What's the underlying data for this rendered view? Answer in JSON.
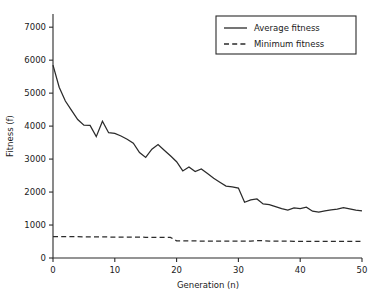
{
  "chart_data": {
    "type": "line",
    "title": "",
    "xlabel": "Generation (n)",
    "ylabel": "Fitness (f)",
    "xlim": [
      0,
      50
    ],
    "ylim": [
      0,
      7400
    ],
    "xticks": [
      0,
      10,
      20,
      30,
      40,
      50
    ],
    "yticks": [
      0,
      1000,
      2000,
      3000,
      4000,
      5000,
      6000,
      7000
    ],
    "xtick_labels": [
      "0",
      "10",
      "20",
      "30",
      "40",
      "50"
    ],
    "ytick_labels": [
      "0",
      "1000",
      "2000",
      "3000",
      "4000",
      "5000",
      "6000",
      "7000"
    ],
    "grid": false,
    "legend_position": "top-right",
    "line_color": "#2b2b2b",
    "background_color": "#ffffff",
    "x": [
      0,
      1,
      2,
      3,
      4,
      5,
      6,
      7,
      8,
      9,
      10,
      11,
      12,
      13,
      14,
      15,
      16,
      17,
      18,
      19,
      20,
      21,
      22,
      23,
      24,
      25,
      26,
      27,
      28,
      29,
      30,
      31,
      32,
      33,
      34,
      35,
      36,
      37,
      38,
      39,
      40,
      41,
      42,
      43,
      44,
      45,
      46,
      47,
      48,
      49,
      50
    ],
    "series": [
      {
        "name": "Average fitness",
        "style": "solid",
        "values": [
          5850,
          5180,
          4760,
          4480,
          4200,
          4030,
          4020,
          3680,
          4150,
          3800,
          3780,
          3700,
          3600,
          3480,
          3200,
          3050,
          3300,
          3440,
          3270,
          3100,
          2920,
          2640,
          2760,
          2620,
          2700,
          2560,
          2420,
          2300,
          2180,
          2160,
          2120,
          1690,
          1760,
          1790,
          1640,
          1620,
          1560,
          1500,
          1450,
          1520,
          1500,
          1540,
          1420,
          1390,
          1430,
          1460,
          1480,
          1530,
          1490,
          1450,
          1430
        ]
      },
      {
        "name": "Minimum fitness",
        "style": "dashed",
        "values": [
          650,
          650,
          648,
          646,
          645,
          643,
          642,
          640,
          638,
          637,
          636,
          634,
          633,
          632,
          630,
          629,
          628,
          626,
          625,
          624,
          520,
          518,
          517,
          516,
          515,
          514,
          513,
          512,
          512,
          511,
          510,
          510,
          509,
          525,
          524,
          512,
          511,
          510,
          509,
          508,
          508,
          507,
          506,
          506,
          505,
          505,
          504,
          504,
          503,
          503,
          502
        ]
      }
    ]
  },
  "legend": {
    "entries": [
      {
        "label": "Average fitness",
        "style": "solid"
      },
      {
        "label": "Minimum fitness",
        "style": "dashed"
      }
    ]
  }
}
